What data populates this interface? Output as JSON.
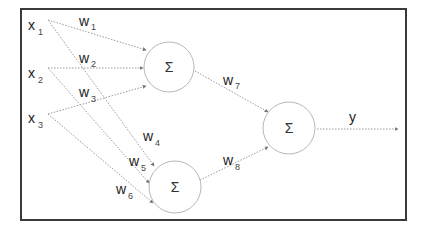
{
  "diagram": {
    "type": "neural-network",
    "colors": {
      "frame": "#3a3a3a",
      "edge": "#9a9a9a",
      "node_stroke": "#b8b8b8",
      "text": "#222222"
    },
    "inputs": [
      {
        "id": "x1",
        "base": "x",
        "sub": "1"
      },
      {
        "id": "x2",
        "base": "x",
        "sub": "2"
      },
      {
        "id": "x3",
        "base": "x",
        "sub": "3"
      }
    ],
    "nodes": [
      {
        "id": "h1",
        "symbol": "Σ"
      },
      {
        "id": "h2",
        "symbol": "Σ"
      },
      {
        "id": "out",
        "symbol": "Σ"
      }
    ],
    "weights": [
      {
        "id": "w1",
        "base": "w",
        "sub": "1",
        "from": "x1",
        "to": "h1"
      },
      {
        "id": "w2",
        "base": "w",
        "sub": "2",
        "from": "x2",
        "to": "h1"
      },
      {
        "id": "w3",
        "base": "w",
        "sub": "3",
        "from": "x3",
        "to": "h1"
      },
      {
        "id": "w4",
        "base": "w",
        "sub": "4",
        "from": "x1",
        "to": "h2"
      },
      {
        "id": "w5",
        "base": "w",
        "sub": "5",
        "from": "x2",
        "to": "h2"
      },
      {
        "id": "w6",
        "base": "w",
        "sub": "6",
        "from": "x3",
        "to": "h2"
      },
      {
        "id": "w7",
        "base": "w",
        "sub": "7",
        "from": "h1",
        "to": "out"
      },
      {
        "id": "w8",
        "base": "w",
        "sub": "8",
        "from": "h2",
        "to": "out"
      }
    ],
    "output": {
      "label": "y"
    }
  }
}
